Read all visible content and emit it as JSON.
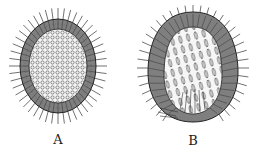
{
  "figure": {
    "panels": [
      {
        "id": "A",
        "label": "A",
        "description": "oval ciliated larva with granular interior",
        "label_x": 58,
        "label_y": 132
      },
      {
        "id": "B",
        "label": "B",
        "description": "egg-shaped ciliated larva with elongated interior cells",
        "label_x": 193,
        "label_y": 133
      }
    ],
    "colors": {
      "ink": "#2a2a2a",
      "layer": "#8c8c8c",
      "background": "#ffffff"
    }
  }
}
